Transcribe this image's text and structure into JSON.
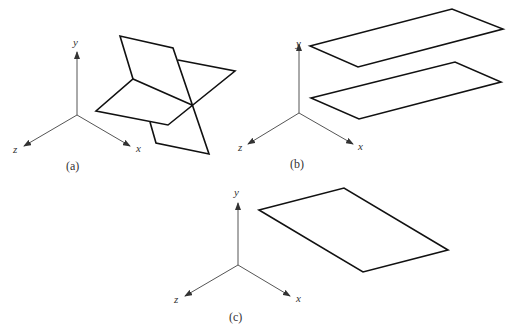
{
  "figure": {
    "panels": [
      {
        "caption": "(a)",
        "axes": {
          "y": "y",
          "x": "x",
          "z": "z"
        },
        "description": "Two planes intersecting along a line"
      },
      {
        "caption": "(b)",
        "axes": {
          "y": "y",
          "x": "x",
          "z": "z"
        },
        "description": "Two parallel planes"
      },
      {
        "caption": "(c)",
        "axes": {
          "y": "y",
          "x": "x",
          "z": "z"
        },
        "description": "A single plane"
      }
    ],
    "colors": {
      "line": "#111111",
      "axis": "#555555",
      "background": "#ffffff"
    }
  }
}
